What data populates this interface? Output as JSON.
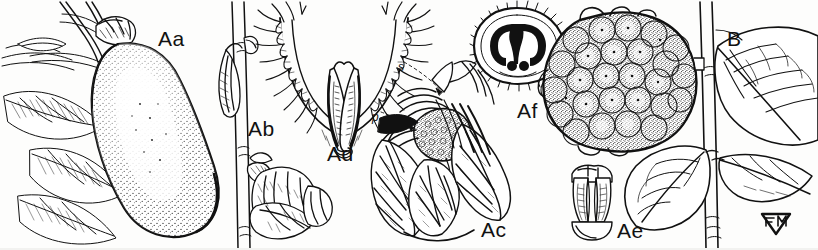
{
  "plate": {
    "width": 818,
    "height": 250,
    "background": "#fdfdfc",
    "ink": "#111111",
    "medium": "pen-and-ink line drawing with stipple shading",
    "subject": "botanical scientific illustration plate"
  },
  "panels": [
    {
      "id": "Aa",
      "label": "Aa",
      "x": 158,
      "y": 28,
      "size": "major",
      "description": "large pendent fruit on twig with leaves, stipple shaded"
    },
    {
      "id": "Ab",
      "label": "Ab",
      "x": 248,
      "y": 118,
      "size": "major",
      "description": "flower bud and young flower on vertical stem"
    },
    {
      "id": "Ad",
      "label": "Ad",
      "x": 327,
      "y": 143,
      "size": "major",
      "description": "longitudinal section of flower showing fringed perianth and paired ovaries"
    },
    {
      "id": "Ac",
      "label": "Ac",
      "x": 481,
      "y": 219,
      "size": "major",
      "description": "dissected flower showing globose stigmatic head and spreading tepals"
    },
    {
      "id": "Af",
      "label": "Af",
      "x": 517,
      "y": 100,
      "size": "major",
      "description": "transverse section of ovary, bristly margin with two dark locules"
    },
    {
      "id": "Ae",
      "label": "Ae",
      "x": 617,
      "y": 220,
      "size": "major",
      "description": "single stamen, ventral view"
    },
    {
      "id": "B",
      "label": "B",
      "x": 727,
      "y": 28,
      "size": "major",
      "description": "aggregate tuberculate fruit and leafy branch"
    }
  ],
  "callouts": [
    {
      "id": "s",
      "label": "s",
      "x": 398,
      "y": 61,
      "description": "leader to stamen in sectioned flower"
    },
    {
      "id": "p",
      "label": "p",
      "x": 372,
      "y": 111,
      "description": "leader to perianth segment"
    }
  ],
  "signature": {
    "label": "FM",
    "x": 773,
    "y": 222,
    "description": "artist monogram, chevron-framed FM"
  }
}
